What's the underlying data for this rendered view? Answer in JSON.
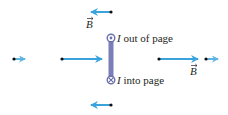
{
  "diagram": {
    "colors": {
      "field_arrow": "#3ba3dc",
      "field_arrow_light": "#7cc3e8",
      "wire": "#7b7fb8",
      "dot": "#111111",
      "text": "#231f20"
    },
    "labels": {
      "current_out": "I out of page",
      "current_out_symbol": "I",
      "current_out_text": " out of page",
      "current_in_symbol": "I",
      "current_in_text": " into page",
      "field_top": "B",
      "field_right": "B"
    },
    "field_points": [
      {
        "name": "top",
        "x": 111,
        "y": 12,
        "direction": "left",
        "length": 20
      },
      {
        "name": "bottom",
        "x": 111,
        "y": 105,
        "direction": "left",
        "length": 20
      },
      {
        "name": "far-left",
        "x": 14,
        "y": 59,
        "direction": "right",
        "length": 10
      },
      {
        "name": "near-left",
        "x": 62,
        "y": 59,
        "direction": "right",
        "length": 40
      },
      {
        "name": "near-right",
        "x": 159,
        "y": 59,
        "direction": "right",
        "length": 38
      },
      {
        "name": "far-right",
        "x": 206,
        "y": 59,
        "direction": "right",
        "length": 11
      }
    ],
    "wire": {
      "x": 111,
      "y_top": 38,
      "y_bottom": 80
    }
  }
}
